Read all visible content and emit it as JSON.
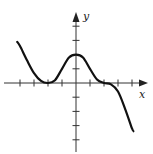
{
  "chart_data": {
    "type": "line",
    "title": "",
    "xlabel": "x",
    "ylabel": "y",
    "xlim": [
      -4.2,
      5
    ],
    "ylim": [
      -4.6,
      4.6
    ],
    "grid": false,
    "legend": null,
    "x_ticks": [
      -4,
      -3,
      -2,
      -1,
      0,
      1,
      2,
      3,
      4
    ],
    "y_ticks": [
      -4,
      -3,
      -2,
      -1,
      1,
      2,
      3,
      4
    ],
    "tick_labels_shown": false,
    "series": [
      {
        "name": "f(x)",
        "x": [
          -4.2,
          -4,
          -3.5,
          -3,
          -2.5,
          -2,
          -1.5,
          -1,
          -0.5,
          0,
          0.5,
          1,
          1.5,
          2,
          2.5,
          3,
          3.5,
          4,
          4.1
        ],
        "values": [
          2.9,
          2.6,
          1.6,
          0.7,
          0.15,
          0,
          0.2,
          1.0,
          1.8,
          2.0,
          1.8,
          1.0,
          0.25,
          0,
          -0.1,
          -0.6,
          -1.8,
          -3.2,
          -3.4
        ]
      }
    ],
    "features": {
      "double_root_touch": -2,
      "local_max": [
        0,
        2
      ],
      "flat_inflection_root": 2
    }
  },
  "axes": {
    "x_label": "x",
    "y_label": "y"
  }
}
